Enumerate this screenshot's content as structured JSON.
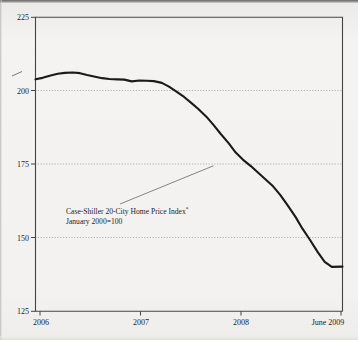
{
  "chart_data": {
    "type": "line",
    "title": "",
    "subtitle": "",
    "xlabel": "",
    "ylabel": "",
    "ylim": [
      125,
      225
    ],
    "yticks": [
      125,
      150,
      175,
      200,
      225
    ],
    "ytick_labels": [
      "125",
      "150",
      "175",
      "200",
      "225"
    ],
    "xtick_labels": [
      "2006",
      "2007",
      "2008",
      "June 2009"
    ],
    "xtick_positions": [
      2006.0,
      2007.0,
      2008.0,
      2009.45
    ],
    "xlim": [
      2006.0,
      2009.45
    ],
    "grid": "horizontal-dotted",
    "legend": "none",
    "annotations": [
      {
        "name": "series-callout",
        "line1": "Case-Shiller 20-City Home Price Index",
        "superscript": "*",
        "line2": "January 2000=100",
        "leader_from": [
          2006.95,
          161.5
        ],
        "leader_to": [
          2008.0,
          174.5
        ]
      }
    ],
    "series": [
      {
        "name": "Case-Shiller 20-City Home Price Index",
        "x": [
          2006.0,
          2006.08,
          2006.17,
          2006.25,
          2006.33,
          2006.42,
          2006.5,
          2006.58,
          2006.67,
          2006.75,
          2006.83,
          2006.92,
          2007.0,
          2007.08,
          2007.17,
          2007.25,
          2007.33,
          2007.42,
          2007.5,
          2007.58,
          2007.67,
          2007.75,
          2007.83,
          2007.92,
          2008.0,
          2008.08,
          2008.17,
          2008.25,
          2008.33,
          2008.42,
          2008.5,
          2008.58,
          2008.67,
          2008.75,
          2008.83,
          2008.92,
          2009.0,
          2009.08,
          2009.17,
          2009.25,
          2009.33,
          2009.45
        ],
        "values": [
          203.9,
          204.4,
          205.2,
          205.8,
          206.1,
          206.2,
          206.0,
          205.4,
          204.8,
          204.3,
          204.0,
          203.9,
          203.8,
          203.2,
          203.5,
          203.4,
          203.3,
          202.7,
          201.4,
          199.8,
          197.9,
          195.9,
          193.8,
          191.2,
          188.4,
          185.4,
          182.2,
          179.0,
          176.6,
          174.4,
          172.2,
          170.0,
          167.5,
          164.6,
          161.2,
          157.2,
          153.1,
          149.5,
          145.2,
          141.8,
          140.1,
          140.2
        ],
        "color": "#1c1a18"
      }
    ]
  },
  "axes": {
    "y_axis_name": "index-value-axis",
    "x_axis_name": "year-axis"
  },
  "figure": {
    "background_color": "#f2f1ef",
    "ink_color": "#1c1a18",
    "grid_color": "#9a9893"
  }
}
